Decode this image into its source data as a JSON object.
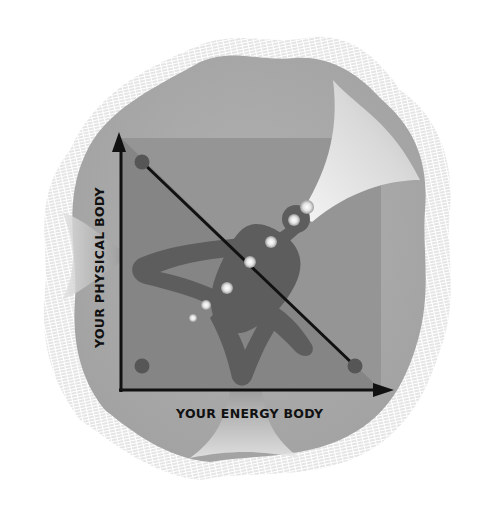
{
  "diagram": {
    "y_axis_label": "YOUR PHYSICAL BODY",
    "x_axis_label": "YOUR ENERGY BODY",
    "figure": "meditating-figure-with-chakras",
    "points": [
      {
        "name": "top-left-dot",
        "x": 142,
        "y": 162
      },
      {
        "name": "bottom-left-dot",
        "x": 142,
        "y": 366
      },
      {
        "name": "bottom-right-dot",
        "x": 355,
        "y": 366
      }
    ],
    "chakras": [
      {
        "x": 307,
        "y": 207,
        "r": 7
      },
      {
        "x": 294,
        "y": 220,
        "r": 6
      },
      {
        "x": 271,
        "y": 242,
        "r": 6
      },
      {
        "x": 250,
        "y": 262,
        "r": 6
      },
      {
        "x": 227,
        "y": 288,
        "r": 6
      },
      {
        "x": 206,
        "y": 305,
        "r": 5
      },
      {
        "x": 193,
        "y": 318,
        "r": 4
      }
    ],
    "colors": {
      "background": "#ffffff",
      "outer_blob": "#a9a9a9",
      "hatch": "#c8c8c8",
      "square": "#8e8e8e",
      "triangle": "#7f7f7f",
      "figure": "#5e5e5e",
      "dots": "#565656",
      "axis": "#111111",
      "beam": "#e6e6e6"
    }
  }
}
